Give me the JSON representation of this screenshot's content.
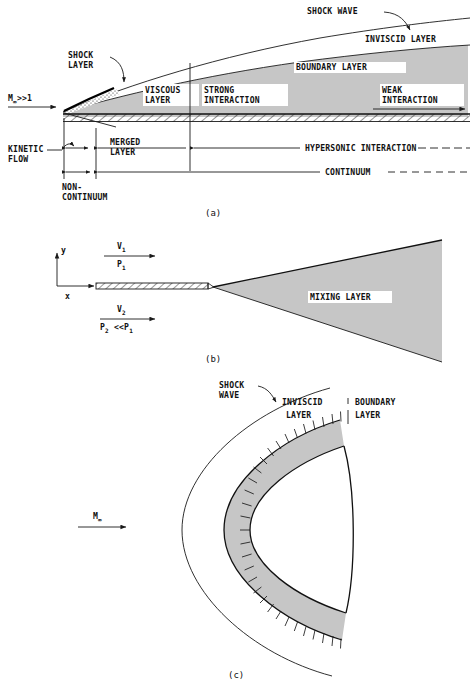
{
  "figure": {
    "accent_gray": "#c6c6c6",
    "line_color": "#1a1a1a",
    "background": "#ffffff"
  },
  "panels": [
    {
      "id": "a",
      "caption": "(a)",
      "freestream_label": "M",
      "freestream_sub": "∞",
      "freestream_rel": ">>1",
      "labels": {
        "shock_wave": "SHOCK WAVE",
        "inviscid_layer": "INVISCID LAYER",
        "boundary_layer": "BOUNDARY LAYER",
        "shock_layer_line1": "SHOCK",
        "shock_layer_line2": "LAYER",
        "viscous_layer_line1": "VISCOUS",
        "viscous_layer_line2": "LAYER",
        "strong_interaction_line1": "STRONG",
        "strong_interaction_line2": "INTERACTION",
        "weak_interaction_line1": "WEAK",
        "weak_interaction_line2": "INTERACTION",
        "kinetic_flow_line1": "KINETIC",
        "kinetic_flow_line2": "FLOW",
        "merged_layer_line1": "MERGED",
        "merged_layer_line2": "LAYER",
        "non_continuum_line1": "NON-",
        "non_continuum_line2": "CONTINUUM",
        "hypersonic_interaction": "HYPERSONIC INTERACTION",
        "continuum": "CONTINUUM"
      }
    },
    {
      "id": "b",
      "caption": "(b)",
      "labels": {
        "axis_y": "y",
        "axis_x": "x",
        "v1": "V",
        "v1_sub": "1",
        "p1": "P",
        "p1_sub": "1",
        "v2": "V",
        "v2_sub": "2",
        "p2": "P",
        "p2_sub": "2",
        "p2_rel": "<<P",
        "p2_rel_sub": "1",
        "mixing_layer": "MIXING LAYER"
      }
    },
    {
      "id": "c",
      "caption": "(c)",
      "freestream_label": "M",
      "freestream_sub": "∞",
      "labels": {
        "shock_wave_line1": "SHOCK",
        "shock_wave_line2": "WAVE",
        "inviscid_layer_line1": "INVISCID",
        "inviscid_layer_line2": "LAYER",
        "boundary_layer_line1": "BOUNDARY",
        "boundary_layer_line2": "LAYER"
      }
    }
  ]
}
